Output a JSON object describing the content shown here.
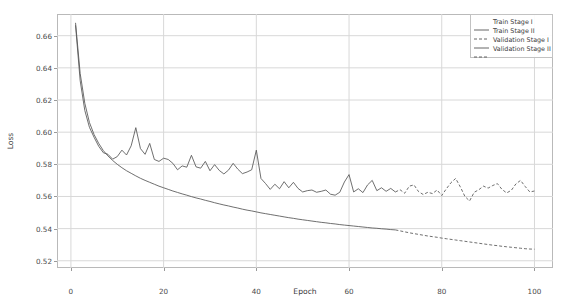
{
  "chart_data": {
    "type": "line",
    "title": "",
    "xlabel": "Epoch",
    "ylabel": "Loss",
    "xlim": [
      -3,
      104
    ],
    "ylim": [
      0.5155,
      0.6735
    ],
    "xticks": [
      0,
      20,
      40,
      60,
      80,
      100
    ],
    "xtick_labels": [
      "0",
      "20",
      "40",
      "60",
      "80",
      "100"
    ],
    "yticks": [
      0.52,
      0.54,
      0.56,
      0.58,
      0.6,
      0.62,
      0.64,
      0.66
    ],
    "ytick_labels": [
      "0.52",
      "0.54",
      "0.56",
      "0.58",
      "0.60",
      "0.62",
      "0.64",
      "0.66"
    ],
    "grid": true,
    "legend_position": "upper right",
    "stage_split_epoch": 70,
    "line_color": "#555555",
    "grid_color": "#d8d8d8",
    "frame_color": "#b9b9b9",
    "series": [
      {
        "name": "Train Stage I",
        "style": "solid",
        "x": [
          1,
          2,
          3,
          4,
          5,
          6,
          7,
          8,
          9,
          10,
          11,
          12,
          13,
          14,
          15,
          16,
          17,
          18,
          19,
          20,
          21,
          22,
          23,
          24,
          25,
          26,
          27,
          28,
          29,
          30,
          31,
          32,
          33,
          34,
          35,
          36,
          37,
          38,
          39,
          40,
          41,
          42,
          43,
          44,
          45,
          46,
          47,
          48,
          49,
          50,
          51,
          52,
          53,
          54,
          55,
          56,
          57,
          58,
          59,
          60,
          61,
          62,
          63,
          64,
          65,
          66,
          67,
          68,
          69,
          70
        ],
        "y": [
          0.668,
          0.6365,
          0.618,
          0.606,
          0.5985,
          0.593,
          0.5885,
          0.5852,
          0.5824,
          0.58,
          0.5779,
          0.576,
          0.5744,
          0.5728,
          0.5713,
          0.57,
          0.5688,
          0.5676,
          0.5664,
          0.5654,
          0.5644,
          0.5634,
          0.5625,
          0.5616,
          0.5608,
          0.5599,
          0.5591,
          0.5584,
          0.5576,
          0.5569,
          0.5561,
          0.5554,
          0.5547,
          0.5541,
          0.5534,
          0.5528,
          0.5521,
          0.5515,
          0.551,
          0.5504,
          0.5498,
          0.5493,
          0.5488,
          0.5483,
          0.5478,
          0.5473,
          0.5468,
          0.5464,
          0.5459,
          0.5455,
          0.5451,
          0.5447,
          0.5443,
          0.5439,
          0.5436,
          0.5432,
          0.5429,
          0.5425,
          0.5422,
          0.5419,
          0.5416,
          0.5413,
          0.541,
          0.5407,
          0.5404,
          0.5402,
          0.5399,
          0.5397,
          0.5394,
          0.5392
        ]
      },
      {
        "name": "Train Stage II",
        "style": "dashed",
        "x": [
          70,
          71,
          72,
          73,
          74,
          75,
          76,
          77,
          78,
          79,
          80,
          81,
          82,
          83,
          84,
          85,
          86,
          87,
          88,
          89,
          90,
          91,
          92,
          93,
          94,
          95,
          96,
          97,
          98,
          99,
          100
        ],
        "y": [
          0.5392,
          0.5386,
          0.538,
          0.5374,
          0.5369,
          0.5364,
          0.5359,
          0.5354,
          0.535,
          0.5346,
          0.5341,
          0.5337,
          0.5333,
          0.5329,
          0.5325,
          0.5321,
          0.5317,
          0.5313,
          0.5309,
          0.5305,
          0.5301,
          0.5297,
          0.5294,
          0.529,
          0.5287,
          0.5284,
          0.5281,
          0.5278,
          0.5275,
          0.5273,
          0.5272
        ]
      },
      {
        "name": "Validation Stage I",
        "style": "solid",
        "x": [
          1,
          2,
          3,
          4,
          5,
          6,
          7,
          8,
          9,
          10,
          11,
          12,
          13,
          14,
          15,
          16,
          17,
          18,
          19,
          20,
          21,
          22,
          23,
          24,
          25,
          26,
          27,
          28,
          29,
          30,
          31,
          32,
          33,
          34,
          35,
          36,
          37,
          38,
          39,
          40,
          41,
          42,
          43,
          44,
          45,
          46,
          47,
          48,
          49,
          50,
          51,
          52,
          53,
          54,
          55,
          56,
          57,
          58,
          59,
          60,
          61,
          62,
          63,
          64,
          65,
          66,
          67,
          68,
          69,
          70
        ],
        "y": [
          0.6665,
          0.632,
          0.6135,
          0.603,
          0.5968,
          0.5912,
          0.5872,
          0.5862,
          0.5832,
          0.5848,
          0.5888,
          0.5858,
          0.5915,
          0.6028,
          0.5898,
          0.5862,
          0.593,
          0.583,
          0.5818,
          0.5838,
          0.583,
          0.5806,
          0.5766,
          0.579,
          0.5782,
          0.5856,
          0.5784,
          0.5776,
          0.5818,
          0.576,
          0.5798,
          0.5762,
          0.574,
          0.5764,
          0.5806,
          0.577,
          0.5742,
          0.5752,
          0.5766,
          0.5888,
          0.5712,
          0.568,
          0.5644,
          0.5676,
          0.5648,
          0.5692,
          0.5654,
          0.5688,
          0.565,
          0.5628,
          0.5636,
          0.564,
          0.5626,
          0.5632,
          0.564,
          0.5614,
          0.5608,
          0.5626,
          0.569,
          0.5736,
          0.5628,
          0.5648,
          0.5624,
          0.5672,
          0.57,
          0.5636,
          0.5654,
          0.5632,
          0.565,
          0.5628
        ]
      },
      {
        "name": "Validation Stage II",
        "style": "dashed",
        "x": [
          70,
          71,
          72,
          73,
          74,
          75,
          76,
          77,
          78,
          79,
          80,
          81,
          82,
          83,
          84,
          85,
          86,
          87,
          88,
          89,
          90,
          91,
          92,
          93,
          94,
          95,
          96,
          97,
          98,
          99,
          100
        ],
        "y": [
          0.5628,
          0.5642,
          0.562,
          0.5664,
          0.5672,
          0.563,
          0.5612,
          0.5626,
          0.5618,
          0.564,
          0.5606,
          0.5648,
          0.5686,
          0.5712,
          0.566,
          0.56,
          0.5572,
          0.5626,
          0.5642,
          0.5664,
          0.5652,
          0.5668,
          0.568,
          0.5644,
          0.5622,
          0.5638,
          0.5678,
          0.57,
          0.5662,
          0.5628,
          0.5634
        ]
      }
    ],
    "legend": [
      {
        "label": "Train Stage I",
        "style": "solid"
      },
      {
        "label": "Train Stage II",
        "style": "dashed"
      },
      {
        "label": "Validation Stage I",
        "style": "solid"
      },
      {
        "label": "Validation Stage II",
        "style": "dashed"
      }
    ]
  }
}
